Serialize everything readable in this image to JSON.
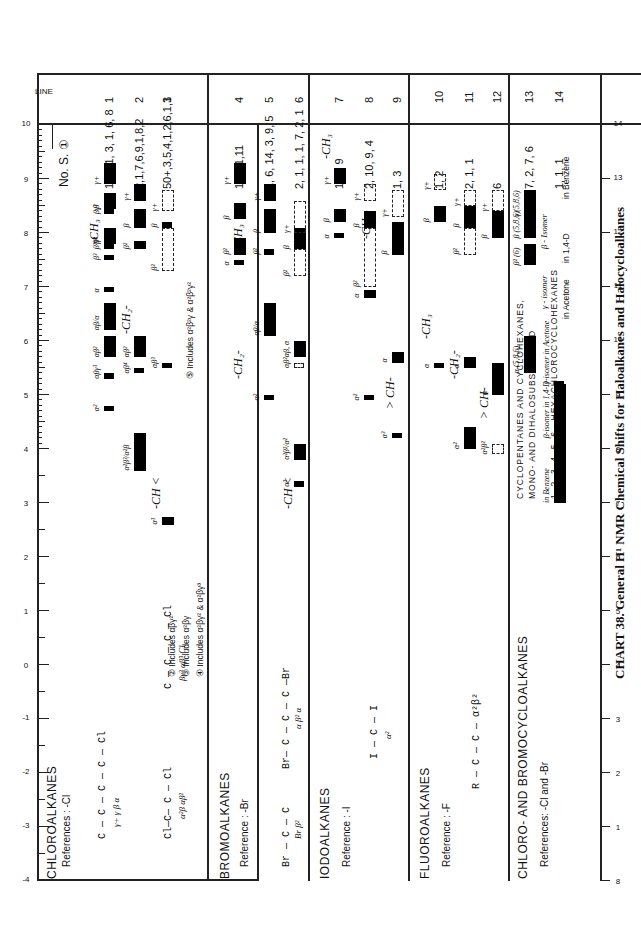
{
  "caption": "CHART 38. General H¹ NMR Chemical Shifts for Haloalkanes and Halocycloalkanes",
  "axis": {
    "unit": "τ",
    "ticks": [
      "-4",
      "-3",
      "-2",
      "-1",
      "0",
      "1",
      "2",
      "3",
      "4",
      "5",
      "6",
      "7",
      "8",
      "9",
      "10"
    ],
    "bottom_ticks": [
      "8",
      "1",
      "2",
      "3",
      "4",
      "5",
      "6",
      "7",
      "8",
      "9",
      "10",
      "11",
      "12",
      "13",
      "14"
    ]
  },
  "header": {
    "line_label": "LINE",
    "ns_label": "No. S. ①"
  },
  "sections": [
    {
      "title": "CHLOROALKANES",
      "reference": "References : -Cl",
      "structure_1": "C — C — C — C — Cl",
      "structure_1_sub": "γ+  γ  β  α",
      "structure_2": "Cl—C— C — Cl",
      "structure_2_sub": "α²β   αβ²",
      "structure_3": "C — C — C — Cl",
      "structure_3_sub": "βγ³  αβ³  Cl",
      "notes": [
        "② Includes  αβγ²",
        "③ Includes  α²βγ",
        "④ Includes  α²βγ² & α²βγ³"
      ],
      "note5": "⑤ Includes  α²β²γ & α²β²γ²",
      "groups": {
        "ch": "-CH <",
        "ch2": "-CH₂-",
        "ch3": "-CH₃"
      },
      "lines": [
        {
          "n": "1",
          "ns": "1, 2, 1, 3, 1, 6, 8"
        },
        {
          "n": "2",
          "ns": "2,1,7,6,9,1,8,2"
        },
        {
          "n": "3",
          "ns": "50+,3,5,4,1,2,6,1,1"
        }
      ]
    },
    {
      "title": "BROMOALKANES",
      "reference": "Reference : -Br",
      "structure_1": "Br — C — C",
      "structure_1_sub": "Br  β²",
      "structure_2": "Br— C — C — C —Br",
      "structure_2_sub": "α   β²   α",
      "groups": {
        "ch": "-CH <",
        "ch2": "-CH₂-",
        "ch3": "-CH₃"
      },
      "lines": [
        {
          "n": "4",
          "ns": "1,1,11,11"
        },
        {
          "n": "5",
          "ns": "1, 6, 14, 3, 9, 5"
        },
        {
          "n": "6",
          "ns": "2, 1, 1, 1, 7, 2, 1"
        }
      ]
    },
    {
      "title": "IODOALKANES",
      "reference": "Reference : -I",
      "structure_1": "I — C — I",
      "structure_1_sub": "α²",
      "groups": {
        "ch": "> CH-",
        "ch2": "-CH₂-",
        "ch3": "-CH₃"
      },
      "lines": [
        {
          "n": "7",
          "ns": "1, 4, 9"
        },
        {
          "n": "8",
          "ns": "2, 10, 9, 4"
        },
        {
          "n": "9",
          "ns": "1, 3"
        }
      ]
    },
    {
      "title": "FLUOROALKANES",
      "reference": "Reference : -F",
      "structure_1": "R — C — C —  α²β²",
      "structure_1_sub": "F F / F F",
      "groups": {
        "ch": "> CH-",
        "ch2": "-CH₂-",
        "ch3": "-CH₃"
      },
      "lines": [
        {
          "n": "10",
          "ns": "1, 2"
        },
        {
          "n": "11",
          "ns": "2, 1, 1"
        },
        {
          "n": "12",
          "ns": "6"
        }
      ]
    },
    {
      "title": "CHLORO- AND  BROMOCYCLOALKANES",
      "reference": "References:  -Cl  and  -Br",
      "sub1": "CYCLOPENTANES   AND   CYCLOHEXANES,",
      "sub2": "MONO-  AND  DIHALOSUBSTITUTED",
      "sub3": "1, 2, 3, 4, 5, 6 - HEXACHLOROCYCLOHEXANES",
      "gamma_isomer": "γ - isomer",
      "in_acetone": "in   Acetone",
      "beta_isomer": "β - Isomer",
      "in_dioxane": "in 1,4-D",
      "in_benzene": "in  Benzene",
      "labels_586": "5 8 6",
      "label_6": "6",
      "lines": [
        {
          "n": "13",
          "ns": "7, 2, 7, 6"
        },
        {
          "n": "14",
          "ns": "1, 1, 1"
        }
      ]
    }
  ],
  "chart_data": {
    "type": "table",
    "title": "CHART 38. General H¹ NMR Chemical Shifts for Haloalkanes and Halocycloalkanes",
    "xlabel": "τ",
    "xlim": [
      -4,
      14
    ],
    "columns": [
      "Class",
      "Line",
      "No. S.",
      "Ranges (τ, approx.)"
    ],
    "rows": [
      {
        "class": "Chloroalkanes",
        "line": 1,
        "ns": "1,2,1,3,1,6,8",
        "ranges": {
          "CH3 α": [
            6.9,
            7.0
          ],
          "β³": [
            7.5,
            7.6
          ],
          "β²γ³": [
            7.7,
            7.8
          ],
          "β²": [
            7.8,
            8.1
          ],
          "βγ³": [
            8.35,
            8.45
          ],
          "β": [
            8.45,
            8.75
          ],
          "γ+": [
            8.9,
            9.3
          ],
          "CH2 αβγ³": [
            5.3,
            5.4
          ],
          "α²": [
            4.7,
            4.8
          ],
          "αβ²": [
            5.7,
            6.1
          ],
          "αβ/α": [
            6.2,
            6.7
          ]
        }
      },
      {
        "class": "Chloroalkanes",
        "line": 2,
        "ns": "2,1,7,6,9,1,8,2",
        "ranges": {
          "CH2 α²β³/α²β": [
            3.6,
            4.3
          ],
          "αβ⁴": [
            5.4,
            5.5
          ],
          "αβ²": [
            5.7,
            6.1
          ],
          "β²": [
            7.7,
            7.85
          ],
          "β": [
            8.1,
            8.45
          ],
          "γ+": [
            8.6,
            8.9
          ]
        }
      },
      {
        "class": "Chloroalkanes",
        "line": 3,
        "ns": "50+,3,5,4,1,2,6,1,1",
        "ranges": {
          "CH α³": [
            2.6,
            2.75
          ],
          "αβ³": [
            5.5,
            5.6
          ],
          "β²": [
            7.3,
            8.1
          ],
          "β": [
            8.1,
            8.2
          ],
          "γ+": [
            8.4,
            8.8
          ]
        }
      },
      {
        "class": "Bromoalkanes",
        "line": 4,
        "ns": "1,1,11,11",
        "ranges": {
          "CH3 α": [
            7.4,
            7.5
          ],
          "β²": [
            7.6,
            7.9
          ],
          "β": [
            8.25,
            8.55
          ],
          "γ+": [
            8.9,
            9.3
          ]
        }
      },
      {
        "class": "Bromoalkanes",
        "line": 5,
        "ns": "1,6,14,3,9,5",
        "ranges": {
          "CH2 α²": [
            4.9,
            5.0
          ],
          "αβ/α": [
            6.1,
            6.7
          ],
          "β²": [
            7.6,
            7.7
          ],
          "β": [
            8.0,
            8.45
          ],
          "γ+": [
            8.6,
            8.9
          ]
        }
      },
      {
        "class": "Bromoalkanes",
        "line": 6,
        "ns": "2,1,1,1,7,2,1",
        "ranges": {
          "CH α³": [
            3.3,
            3.4
          ],
          "α²β²/α²": [
            3.8,
            4.1
          ],
          "αβ²": [
            5.5,
            5.6
          ],
          "αβ, α": [
            5.7,
            6.0
          ],
          "β²": [
            7.2,
            7.7
          ],
          "β": [
            7.7,
            8.1
          ],
          "γ+": [
            8.0,
            8.6
          ]
        }
      },
      {
        "class": "Iodoalkanes",
        "line": 7,
        "ns": "1,4,9",
        "ranges": {
          "CH3 α": [
            7.9,
            8.0
          ],
          "β": [
            8.2,
            8.45
          ],
          "γ+": [
            8.9,
            9.2
          ]
        }
      },
      {
        "class": "Iodoalkanes",
        "line": 8,
        "ns": "2,10,9,4",
        "ranges": {
          "CH2 α²": [
            4.9,
            5.0
          ],
          "α": [
            6.8,
            6.95
          ],
          "β²": [
            7.0,
            8.1
          ],
          "β": [
            8.1,
            8.4
          ],
          "γ+": [
            8.6,
            8.9
          ]
        }
      },
      {
        "class": "Iodoalkanes",
        "line": 9,
        "ns": "1,3",
        "ranges": {
          "CH α³": [
            4.2,
            4.3
          ],
          "CH2 α": [
            5.6,
            5.8
          ],
          "β": [
            7.6,
            8.2
          ],
          "γ+": [
            8.3,
            8.8
          ]
        }
      },
      {
        "class": "Fluoroalkanes",
        "line": 10,
        "ns": "1,2",
        "ranges": {
          "CH3 α": [
            5.5,
            5.6
          ],
          "β": [
            8.2,
            8.5
          ],
          "γ+": [
            8.8,
            9.1
          ]
        }
      },
      {
        "class": "Fluoroalkanes",
        "line": 11,
        "ns": "2,1,1",
        "ranges": {
          "CH2 α²": [
            4.0,
            4.4
          ],
          "α": [
            5.5,
            5.7
          ],
          "β²": [
            7.6,
            8.1
          ],
          "β": [
            8.1,
            8.5
          ],
          "γ+": [
            8.5,
            8.8
          ]
        }
      },
      {
        "class": "Fluoroalkanes",
        "line": 12,
        "ns": "6",
        "ranges": {
          "CH2 α²β²": [
            3.9,
            4.1
          ],
          "α": [
            5.0,
            5.6
          ],
          "β": [
            7.9,
            8.4
          ],
          "γ+": [
            8.4,
            8.8
          ]
        }
      },
      {
        "class": "Chloro- and Bromocycloalkanes",
        "line": 13,
        "ns": "7,2,7,6",
        "ranges": {
          "α (5,8,6)": [
            5.4,
            6.1
          ],
          "β² (6)": [
            7.4,
            7.8
          ],
          "β (5,8,6)": [
            7.9,
            8.4
          ],
          "γ (5,8,6)": [
            8.3,
            8.8
          ]
        }
      },
      {
        "class": "Hexachlorocyclohexanes",
        "line": 14,
        "ns": "1,1,1",
        "ranges": {
          "γ-isomer in Acetone": [
            5.2,
            5.25
          ],
          "β-isomer in 1,4-D": [
            4.2,
            5.2
          ],
          "in Benzene": [
            3.0,
            4.2
          ]
        }
      }
    ]
  }
}
